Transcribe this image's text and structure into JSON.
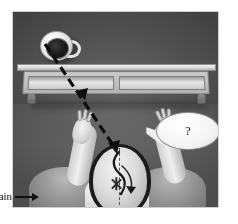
{
  "figure": {
    "kind": "grayscale-illustration",
    "frame": {
      "background_color": "#5a5a5a",
      "border_color": "#cfcfcf"
    },
    "annotations": {
      "brain_label": "rain",
      "brain_label_full": "brain",
      "brain_arrow_icon": "right-arrow-icon",
      "question_mark": "?"
    },
    "objects": {
      "coffee_cup": {
        "name": "coffee-cup",
        "cup_color": "#e3e3e3",
        "coffee_color": "#181818",
        "handle_side": "right"
      },
      "shelf": {
        "name": "wall-shelf",
        "panel_count": 2,
        "top_color": "#dcdcdc",
        "front_color": "#b2b2b2",
        "leg_color": "#8d8d8d"
      },
      "person": {
        "name": "person-top-down",
        "hair_color": "#1b1b1b",
        "skin_color": "#dcdcdc",
        "shirt_color": "#ededed",
        "arms_raised": "both"
      },
      "trajectory": {
        "name": "impact-trajectory",
        "style": "dashed",
        "color": "#0d0d0d",
        "from": "coffee cup on shelf",
        "to": "top of head"
      },
      "impact_marker": {
        "name": "impact-x-mark",
        "symbol": "X",
        "color": "#2a2a2a"
      },
      "internal_arrow": {
        "name": "brain-movement-arrow",
        "color": "#1a1a1a"
      },
      "speech_bubble": {
        "name": "speech-bubble",
        "fill_color": "#f4f4f4",
        "border_color": "#8f8f8f"
      }
    }
  }
}
